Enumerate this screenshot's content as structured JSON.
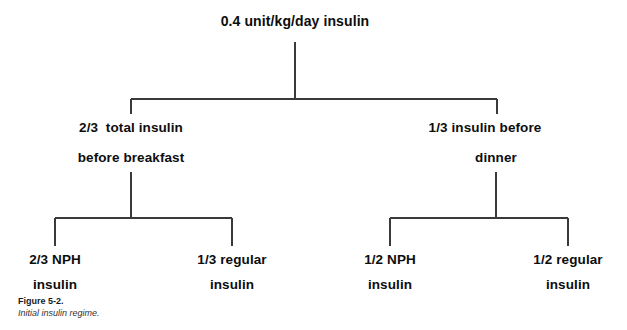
{
  "figure": {
    "caption_label": "Figure 5-2.",
    "caption_text": "Initial insulin regime.",
    "line_color": "#3a3a3a",
    "text_color": "#0d0d0d",
    "background": "#ffffff"
  },
  "tree": {
    "root": {
      "label": "0.4 unit/kg/day insulin"
    },
    "level2": [
      {
        "line1": "2/3  total insulin",
        "line2": "before breakfast"
      },
      {
        "line1": "1/3 insulin before",
        "line2": "dinner"
      }
    ],
    "leaves": [
      {
        "line1": "2/3 NPH",
        "line2": "insulin"
      },
      {
        "line1": "1/3 regular",
        "line2": "insulin"
      },
      {
        "line1": "1/2 NPH",
        "line2": "insulin"
      },
      {
        "line1": "1/2 regular",
        "line2": "insulin"
      }
    ]
  }
}
